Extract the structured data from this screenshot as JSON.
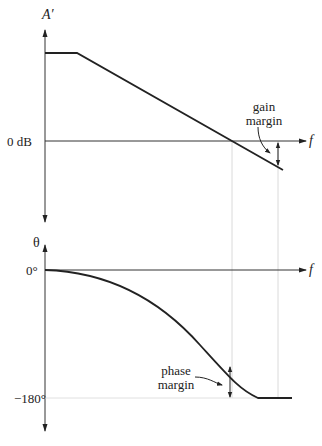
{
  "magnitude_plot": {
    "y_axis_label": "A′",
    "zero_label": "0 dB",
    "x_axis_label": "f",
    "annotation": {
      "line1": "gain",
      "line2": "margin"
    }
  },
  "phase_plot": {
    "y_axis_label": "θ",
    "zero_label": "0°",
    "minus180_label": "−180°",
    "x_axis_label": "f",
    "annotation": {
      "line1": "phase",
      "line2": "margin"
    }
  },
  "colors": {
    "line": "#222222",
    "guide": "#c8c8c8"
  }
}
